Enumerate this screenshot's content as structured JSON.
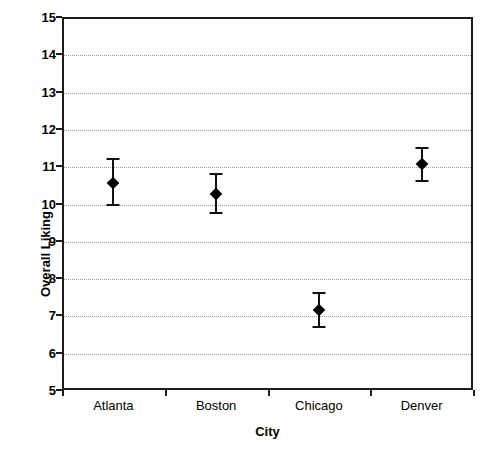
{
  "chart_data": {
    "type": "scatter",
    "title": "",
    "subtitle": "",
    "xlabel": "City",
    "ylabel": "Overall Liking",
    "categories": [
      "Atlanta",
      "Boston",
      "Chicago",
      "Denver"
    ],
    "values": [
      10.55,
      10.25,
      7.15,
      11.05
    ],
    "error_low": [
      9.95,
      9.75,
      6.7,
      10.6
    ],
    "error_high": [
      11.2,
      10.8,
      7.6,
      11.5
    ],
    "series": [
      {
        "name": "Overall Liking",
        "values": [
          10.55,
          10.25,
          7.15,
          11.05
        ],
        "error_low": [
          9.95,
          9.75,
          6.7,
          10.6
        ],
        "error_high": [
          11.2,
          10.8,
          7.6,
          11.5
        ]
      }
    ],
    "points": [
      {
        "category": "Atlanta",
        "value": 10.55,
        "low": 9.95,
        "high": 11.2
      },
      {
        "category": "Boston",
        "value": 10.25,
        "low": 9.75,
        "high": 10.8
      },
      {
        "category": "Chicago",
        "value": 7.15,
        "low": 6.7,
        "high": 7.6
      },
      {
        "category": "Denver",
        "value": 11.05,
        "low": 10.6,
        "high": 11.5
      }
    ],
    "ylim": [
      5,
      15
    ],
    "ytick_labels": [
      "15",
      "14",
      "13",
      "12",
      "11",
      "10",
      "9",
      "8",
      "7",
      "6",
      "5"
    ],
    "yticks": [
      15,
      14,
      13,
      12,
      11,
      10,
      9,
      8,
      7,
      6,
      5
    ],
    "grid": true,
    "gridline_style": "dotted",
    "legend": false,
    "legend_position": "none",
    "marker": "diamond",
    "error_bars": "capped",
    "colors": {
      "marker": "#000000",
      "error_bar": "#111111",
      "axis": "#1c1c1c",
      "gridline": "#9a9a9a",
      "plot_background": "#ffffff",
      "text": "#000000"
    }
  }
}
